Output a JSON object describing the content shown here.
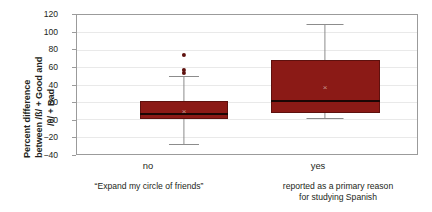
{
  "chart_data": {
    "type": "box",
    "title": "",
    "subtitle": "",
    "xlabel": "reported as a primary reason for studying Spanish",
    "ylabel": "Percent difference between /ß/ + Good and /θ/ + Bad",
    "ylabel_line1": "Percent difference",
    "ylabel_line2": "between /ß/ + Good and",
    "ylabel_line3": "/θ/ + Bad",
    "ylim": [
      -40,
      120
    ],
    "yticks": [
      120,
      100,
      80,
      60,
      40,
      20,
      0,
      -20,
      -40
    ],
    "ytick_labels": [
      "120",
      "100",
      "80",
      "60",
      "40",
      "20",
      "0",
      "−20",
      "−40"
    ],
    "grid": true,
    "grid_axis": "y",
    "legend": "none",
    "categories": [
      "no",
      "yes"
    ],
    "category_sublabels": [
      "“Expand my circle of friends”",
      "reported as a primary reason\nfor studying Spanish"
    ],
    "series": [
      {
        "name": "no",
        "whisker_low": -28,
        "q1": 0,
        "median": 6,
        "q3": 21,
        "whisker_high": 50,
        "mean": 9,
        "outliers": [
          53,
          57,
          74
        ]
      },
      {
        "name": "yes",
        "whisker_low": 2,
        "q1": 7,
        "median": 21,
        "q3": 68,
        "whisker_high": 110,
        "mean": 37,
        "outliers": []
      }
    ],
    "colors": {
      "box_fill": "#8b1a16",
      "box_edge": "#5e110e",
      "median": "#1a0604",
      "whisker": "#8c8c8c",
      "outlier": "#5e110e",
      "mean_marker": "#c9968f",
      "grid": "#e9e9e9",
      "frame": "#9b9b9b",
      "text": "#231f20",
      "background": "#ffffff"
    }
  },
  "axis": {
    "y_label_line1": "Percent difference",
    "y_label_line2": "between /ß/ + Good and",
    "y_label_line3": "/θ/ + Bad"
  },
  "categories": {
    "left": {
      "tick_label": "no",
      "caption": "“Expand my circle of friends”"
    },
    "right": {
      "tick_label": "yes",
      "caption_line1": "reported as a primary reason",
      "caption_line2": "for studying Spanish"
    }
  },
  "yticks": {
    "t0": "120",
    "t1": "100",
    "t2": "80",
    "t3": "60",
    "t4": "40",
    "t5": "20",
    "t6": "0",
    "t7": "−20",
    "t8": "−40"
  }
}
